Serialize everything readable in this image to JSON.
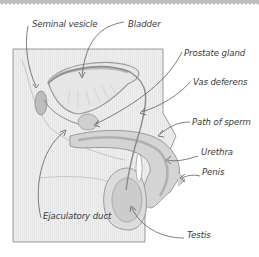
{
  "diagram": {
    "type": "anatomical-labeled-diagram",
    "labels": [
      {
        "id": "seminal-vesicle",
        "text": "Seminal vesicle",
        "x": 32,
        "y": 19
      },
      {
        "id": "bladder",
        "text": "Bladder",
        "x": 128,
        "y": 19
      },
      {
        "id": "prostate-gland",
        "text": "Prostate gland",
        "x": 184,
        "y": 48
      },
      {
        "id": "vas-deferens",
        "text": "Vas deferens",
        "x": 193,
        "y": 77
      },
      {
        "id": "path-of-sperm",
        "text": "Path of sperm",
        "x": 192,
        "y": 117
      },
      {
        "id": "urethra",
        "text": "Urethra",
        "x": 201,
        "y": 147
      },
      {
        "id": "penis",
        "text": "Penis",
        "x": 202,
        "y": 167
      },
      {
        "id": "ejaculatory-duct",
        "text": "Ejaculatory duct",
        "x": 43,
        "y": 211
      },
      {
        "id": "testis",
        "text": "Testis",
        "x": 187,
        "y": 230
      }
    ],
    "colors": {
      "panel": "#ececec",
      "panel_border": "#9a9a9a",
      "organ_fill": "#d6d6d6",
      "organ_dark": "#bdbdbd",
      "line": "#6e6e6e",
      "text": "#3a3a3a",
      "top_border": "#b5b5b5"
    }
  }
}
